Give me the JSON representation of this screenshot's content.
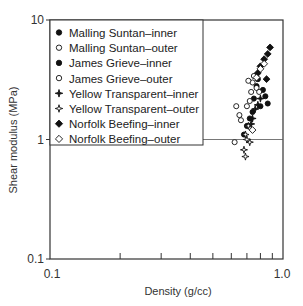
{
  "chart_data": {
    "type": "scatter",
    "title": "",
    "xlabel": "Density (g/cc)",
    "ylabel": "Shear modulus (MPa)",
    "xscale": "log",
    "yscale": "log",
    "xlim": [
      0.1,
      1.0
    ],
    "ylim": [
      0.1,
      10
    ],
    "x_tick_labels": [
      "0.1",
      "1.0"
    ],
    "y_tick_labels": [
      "0.1",
      "1",
      "10"
    ],
    "x_minor_ticks": [
      0.2,
      0.3,
      0.4,
      0.5,
      0.6,
      0.7,
      0.8,
      0.9
    ],
    "grid": false,
    "legend_position": "upper left",
    "series": [
      {
        "name": "Malling Suntan–inner",
        "marker": "filled-circle",
        "points": [
          [
            0.78,
            3.2
          ],
          [
            0.82,
            2.6
          ],
          [
            0.75,
            2.2
          ],
          [
            0.8,
            1.9
          ],
          [
            0.72,
            1.5
          ],
          [
            0.77,
            2.8
          ]
        ]
      },
      {
        "name": "Malling Suntan–outer",
        "marker": "open-circle",
        "points": [
          [
            0.75,
            3.4
          ],
          [
            0.74,
            3.0
          ],
          [
            0.77,
            2.7
          ],
          [
            0.73,
            2.5
          ],
          [
            0.79,
            2.5
          ],
          [
            0.71,
            3.1
          ]
        ]
      },
      {
        "name": "James Grieve–inner",
        "marker": "filled-circle",
        "points": [
          [
            0.7,
            1.3
          ],
          [
            0.68,
            1.1
          ],
          [
            0.74,
            1.7
          ],
          [
            0.84,
            2.3
          ],
          [
            0.86,
            2.0
          ]
        ]
      },
      {
        "name": "James Grieve–outer",
        "marker": "open-circle",
        "points": [
          [
            0.63,
            1.9
          ],
          [
            0.65,
            1.6
          ],
          [
            0.66,
            1.45
          ],
          [
            0.62,
            0.95
          ],
          [
            0.7,
            1.9
          ],
          [
            0.72,
            2.1
          ]
        ]
      },
      {
        "name": "Yellow Transparent–inner",
        "marker": "filled-star",
        "points": [
          [
            0.76,
            1.8
          ],
          [
            0.78,
            1.95
          ],
          [
            0.74,
            1.5
          ],
          [
            0.8,
            2.2
          ],
          [
            0.73,
            1.35
          ]
        ]
      },
      {
        "name": "Yellow Transparent–outer",
        "marker": "open-star",
        "points": [
          [
            0.69,
            1.1
          ],
          [
            0.72,
            0.95
          ],
          [
            0.7,
            1.0
          ],
          [
            0.68,
            0.82
          ],
          [
            0.69,
            0.72
          ],
          [
            0.71,
            1.3
          ]
        ]
      },
      {
        "name": "Norfolk Beefing–inner",
        "marker": "filled-diamond",
        "points": [
          [
            0.88,
            5.9
          ],
          [
            0.86,
            5.2
          ],
          [
            0.83,
            4.7
          ],
          [
            0.8,
            4.1
          ],
          [
            0.78,
            3.6
          ],
          [
            0.85,
            3.2
          ]
        ]
      },
      {
        "name": "Norfolk Beefing–outer",
        "marker": "open-diamond",
        "points": [
          [
            0.8,
            3.9
          ],
          [
            0.83,
            4.3
          ],
          [
            0.77,
            3.3
          ],
          [
            0.74,
            1.2
          ]
        ]
      }
    ]
  },
  "axes": {
    "x_title": "Density (g/cc)",
    "y_title": "Shear modulus (MPa)",
    "x_min_label": "0.1",
    "x_max_label": "1.0",
    "y_labels": [
      "10",
      "1",
      "0.1"
    ]
  },
  "legend": {
    "items": [
      {
        "label": "Malling Suntan–inner",
        "marker": "filled-circle"
      },
      {
        "label": "Malling Suntan–outer",
        "marker": "open-circle"
      },
      {
        "label": "James Grieve–inner",
        "marker": "filled-circle"
      },
      {
        "label": "James Grieve–outer",
        "marker": "open-circle"
      },
      {
        "label": "Yellow Transparent–inner",
        "marker": "filled-star"
      },
      {
        "label": "Yellow Transparent–outer",
        "marker": "open-star"
      },
      {
        "label": "Norfolk Beefing–inner",
        "marker": "filled-diamond"
      },
      {
        "label": "Norfolk Beefing–outer",
        "marker": "open-diamond"
      }
    ]
  },
  "colors": {
    "ink": "#111111",
    "axis": "#333333",
    "background": "#ffffff"
  }
}
